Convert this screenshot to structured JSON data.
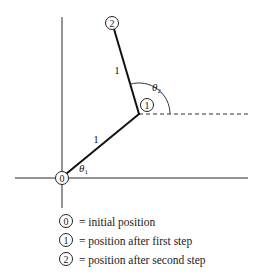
{
  "diagram": {
    "type": "two-link arm / random walk steps",
    "nodes": [
      {
        "id": "0",
        "label": "0",
        "x": 62,
        "y": 178
      },
      {
        "id": "1",
        "label": "1",
        "x": 139,
        "y": 114,
        "label_x": 147,
        "label_y": 105
      },
      {
        "id": "2",
        "label": "2",
        "x": 114,
        "y": 30,
        "label_x": 112,
        "label_y": 23
      }
    ],
    "segments": [
      {
        "from": "0",
        "to": "1",
        "length_label": "1"
      },
      {
        "from": "1",
        "to": "2",
        "length_label": "1"
      }
    ],
    "angles": [
      {
        "symbol": "θ",
        "subscript": "1",
        "description": "angle between horizontal axis and first step"
      },
      {
        "symbol": "θ",
        "subscript": "2",
        "description": "angle between horizontal reference (dashed) and second step"
      }
    ],
    "reference_line": "dashed horizontal through node 1"
  },
  "legend": [
    {
      "node": "0",
      "text": "= initial position"
    },
    {
      "node": "1",
      "text": "= position after first step"
    },
    {
      "node": "2",
      "text": "= position after second step"
    }
  ],
  "colors": {
    "line": "#111111",
    "axis": "#2a2a2a",
    "background": "#ffffff"
  }
}
